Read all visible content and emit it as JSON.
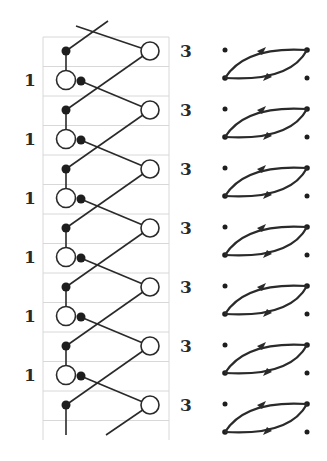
{
  "diagram": {
    "left_labels": [
      "1",
      "1",
      "1",
      "1",
      "1",
      "1"
    ],
    "right_labels": [
      "3",
      "3",
      "3",
      "3",
      "3",
      "3",
      "3"
    ],
    "period_count": 7,
    "colors": {
      "line": "#2a2a2a",
      "grid": "#d8d8d8",
      "node_fill_open": "#ffffff",
      "node_fill_solid": "#1e1e1e"
    },
    "lens_glyphs": 7
  }
}
